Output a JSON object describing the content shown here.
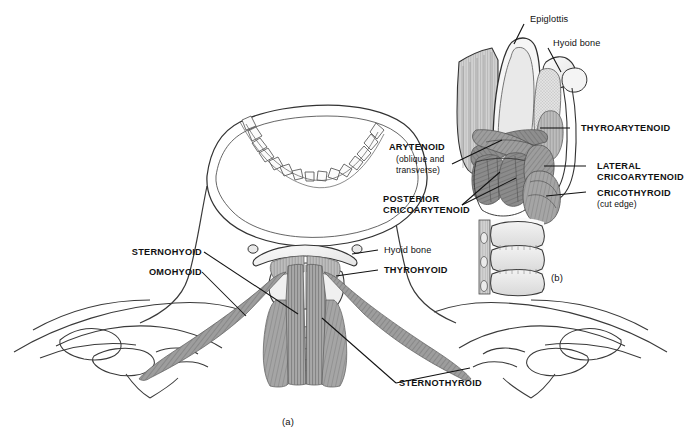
{
  "figure": {
    "title_present": false,
    "panels": [
      {
        "id": "a",
        "caption": "(a)",
        "description": "anterior view of neck, hyoid bone, larynx, trachea, clavicles and scapulae with infrahyoid (strap) muscles"
      },
      {
        "id": "b",
        "caption": "(b)",
        "description": "posterolateral view of larynx showing epiglottis, hyoid bone, intrinsic laryngeal muscles and tracheal rings"
      }
    ],
    "colors": {
      "ink": "#111111",
      "outline": "#2b2b2b",
      "muscle_dark": "#767676",
      "muscle_mid": "#9a9a9a",
      "muscle_light": "#c4c4c4",
      "cartilage": "#e8e8e8",
      "bone": "#f2f2f2",
      "background": "#ffffff"
    }
  },
  "panel_a": {
    "caption": "(a)",
    "labels_left": [
      {
        "id": "sternohyoid",
        "text": "STERNOHYOID",
        "style": "caps"
      },
      {
        "id": "omohyoid",
        "text": "OMOHYOID",
        "style": "caps"
      }
    ],
    "labels_right": [
      {
        "id": "hyoid-bone-a",
        "text": "Hyoid bone",
        "style": "plain"
      },
      {
        "id": "thyrohyoid",
        "text": "THYROHYOID",
        "style": "caps"
      }
    ],
    "labels_bottom": [
      {
        "id": "sternothyroid",
        "text": "STERNOTHYROID",
        "style": "caps"
      }
    ]
  },
  "panel_b": {
    "caption": "(b)",
    "labels_top": [
      {
        "id": "epiglottis",
        "text": "Epiglottis",
        "style": "plain"
      },
      {
        "id": "hyoid-bone-b",
        "text": "Hyoid bone",
        "style": "plain"
      }
    ],
    "labels_left": [
      {
        "id": "arytenoid",
        "text": "ARYTENOID",
        "style": "caps"
      },
      {
        "id": "arytenoid-sub-1",
        "text": "(oblique and",
        "style": "sub"
      },
      {
        "id": "arytenoid-sub-2",
        "text": "transverse)",
        "style": "sub"
      },
      {
        "id": "posterior",
        "text": "POSTERIOR",
        "style": "caps"
      },
      {
        "id": "posterior-cricoarytenoid",
        "text": "CRICOARYTENOID",
        "style": "caps"
      }
    ],
    "labels_right": [
      {
        "id": "thyroarytenoid",
        "text": "THYROARYTENOID",
        "style": "caps"
      },
      {
        "id": "lateral",
        "text": "LATERAL",
        "style": "caps"
      },
      {
        "id": "lateral-cricoarytenoid",
        "text": "CRICOARYTENOID",
        "style": "caps"
      },
      {
        "id": "cricothyroid",
        "text": "CRICOTHYROID",
        "style": "caps"
      },
      {
        "id": "cricothyroid-sub",
        "text": "(cut edge)",
        "style": "sub"
      }
    ]
  }
}
